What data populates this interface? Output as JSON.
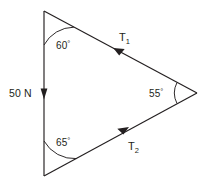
{
  "diagram": {
    "type": "force-vector-triangle",
    "stroke_color": "#231f20",
    "background_color": "#ffffff",
    "vertices": {
      "top": [
        44,
        11
      ],
      "bottom_left": [
        44,
        176
      ],
      "right": [
        197,
        93
      ]
    },
    "angles": [
      {
        "id": "top",
        "value": "60",
        "degree_symbol": "°",
        "label": "60°",
        "vertex": "top"
      },
      {
        "id": "bottom_left",
        "value": "65",
        "degree_symbol": "°",
        "label": "65°",
        "vertex": "bottom_left"
      },
      {
        "id": "right",
        "value": "55",
        "degree_symbol": "°",
        "label": "55°",
        "vertex": "right"
      }
    ],
    "forces": [
      {
        "id": "weight",
        "label": "50 N",
        "magnitude": "50",
        "unit": "N",
        "side": "left-vertical",
        "arrow_direction": "down"
      },
      {
        "id": "tension-1",
        "label": "T1",
        "symbol": "T",
        "subscript": "1",
        "side": "upper",
        "arrow_direction": "up-left"
      },
      {
        "id": "tension-2",
        "label": "T2",
        "symbol": "T",
        "subscript": "2",
        "side": "lower",
        "arrow_direction": "up-right"
      }
    ]
  }
}
